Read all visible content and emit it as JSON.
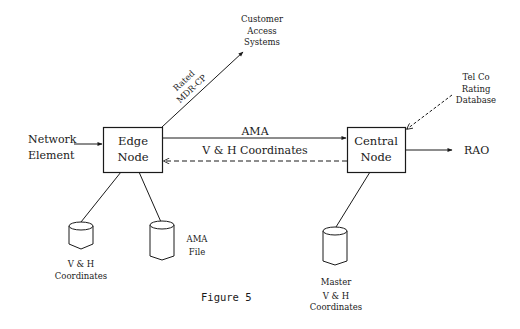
{
  "figure": {
    "caption": "Figure 5"
  },
  "nodes": {
    "edge_node": {
      "lines": [
        "Edge",
        "Node"
      ]
    },
    "central_node": {
      "lines": [
        "Central",
        "Node"
      ]
    }
  },
  "external": {
    "network_element": {
      "lines": [
        "Network",
        "Element"
      ]
    },
    "customer_access_systems": {
      "lines": [
        "Customer",
        "Access",
        "Systems"
      ]
    },
    "telco_rating_database": {
      "lines": [
        "Tel Co",
        "Rating",
        "Database"
      ]
    },
    "rao": {
      "label": "RAO"
    }
  },
  "databases": {
    "vh_coordinates": {
      "lines": [
        "V & H",
        "Coordinates"
      ]
    },
    "ama_file": {
      "lines": [
        "AMA",
        "File"
      ]
    },
    "master_vh_coordinates": {
      "lines": [
        "Master",
        "V & H",
        "Coordinates"
      ]
    }
  },
  "edges": {
    "ama": {
      "label": "AMA",
      "style": "solid",
      "from": "Edge Node",
      "to": "Central Node"
    },
    "vh_coordinates_flow": {
      "label": "V & H Coordinates",
      "style": "dashed",
      "from": "Central Node",
      "to": "Edge Node"
    },
    "rated_mdr_cp": {
      "lines": [
        "Rated",
        "MDR-CP"
      ],
      "style": "solid",
      "from": "Edge Node",
      "to": "Customer Access Systems"
    },
    "network_input": {
      "style": "solid",
      "from": "Network Element",
      "to": "Edge Node"
    },
    "rating_db_flow": {
      "style": "dashed",
      "from": "Tel Co Rating Database",
      "to": "Central Node"
    },
    "rao_output": {
      "style": "solid",
      "from": "Central Node",
      "to": "RAO"
    }
  },
  "colors": {
    "ink": "#1a1a1a",
    "background": "#ffffff"
  }
}
